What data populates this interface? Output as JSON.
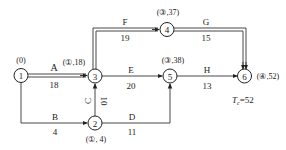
{
  "diagram": {
    "type": "activity-on-arrow network (critical path labeling)",
    "nodes": [
      {
        "id": "1",
        "label": "1",
        "tag": "(0)"
      },
      {
        "id": "2",
        "label": "2",
        "tag": "(①, 4)"
      },
      {
        "id": "3",
        "label": "3",
        "tag": "(①,18)"
      },
      {
        "id": "4",
        "label": "4",
        "tag": "(③,37)"
      },
      {
        "id": "5",
        "label": "5",
        "tag": "(③,38)"
      },
      {
        "id": "6",
        "label": "6",
        "tag": "(④,52)"
      }
    ],
    "activities": [
      {
        "name": "A",
        "from": "1",
        "to": "3",
        "duration": "18",
        "critical": true
      },
      {
        "name": "B",
        "from": "1",
        "to": "2",
        "duration": "4",
        "critical": false
      },
      {
        "name": "C",
        "from": "2",
        "to": "3",
        "duration": "10",
        "critical": false
      },
      {
        "name": "D",
        "from": "2",
        "to": "5",
        "duration": "11",
        "critical": false
      },
      {
        "name": "E",
        "from": "3",
        "to": "5",
        "duration": "20",
        "critical": false
      },
      {
        "name": "F",
        "from": "3",
        "to": "4",
        "duration": "19",
        "critical": true
      },
      {
        "name": "G",
        "from": "4",
        "to": "6",
        "duration": "15",
        "critical": true
      },
      {
        "name": "H",
        "from": "5",
        "to": "6",
        "duration": "13",
        "critical": false
      }
    ],
    "total_time": {
      "symbol": "T",
      "subscript": "c",
      "value": "=52"
    }
  }
}
